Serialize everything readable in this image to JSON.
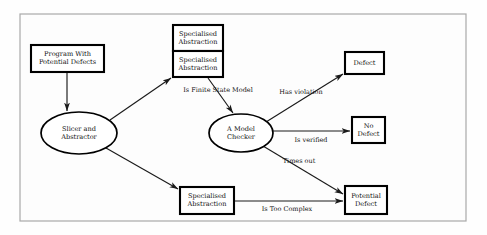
{
  "diagram": {
    "frame": {
      "x": 20,
      "y": 14,
      "width": 446,
      "height": 207
    },
    "colors": {
      "background": "#fefefe",
      "frame_stroke": "#a9a9a9",
      "node_stroke": "#000000",
      "node_fill": "#ffffff",
      "edge_stroke": "#1a1a1a",
      "text": "#111111"
    },
    "nodes": [
      {
        "id": "program",
        "shape": "rect",
        "lines": [
          "Program With",
          "Potential Defects"
        ],
        "x": 31,
        "y": 45,
        "width": 73,
        "height": 27
      },
      {
        "id": "spec-abstraction-top",
        "shape": "rect",
        "lines": [
          "Specialised",
          "Abstraction"
        ],
        "x": 173,
        "y": 25,
        "width": 50,
        "height": 26
      },
      {
        "id": "spec-abstraction-mid",
        "shape": "rect",
        "lines": [
          "Specialised",
          "Abstraction"
        ],
        "x": 173,
        "y": 51,
        "width": 50,
        "height": 26
      },
      {
        "id": "spec-abstraction-bottom",
        "shape": "rect",
        "lines": [
          "Specialised",
          "Abstraction"
        ],
        "x": 180,
        "y": 187,
        "width": 54,
        "height": 27
      },
      {
        "id": "defect",
        "shape": "rect",
        "lines": [
          "Defect"
        ],
        "x": 345,
        "y": 52,
        "width": 39,
        "height": 22
      },
      {
        "id": "no-defect",
        "shape": "rect",
        "lines": [
          "No",
          "Defect"
        ],
        "x": 352,
        "y": 117,
        "width": 33,
        "height": 26
      },
      {
        "id": "potential-defect",
        "shape": "rect",
        "lines": [
          "Potential",
          "Defect"
        ],
        "x": 345,
        "y": 186,
        "width": 42,
        "height": 28
      },
      {
        "id": "slicer",
        "shape": "ellipse",
        "lines": [
          "Slicer and",
          "Abstractor"
        ],
        "cx": 79,
        "cy": 133,
        "rx": 38,
        "ry": 21
      },
      {
        "id": "model-checker",
        "shape": "ellipse",
        "lines": [
          "A Model",
          "Checker"
        ],
        "cx": 241,
        "cy": 133,
        "rx": 32,
        "ry": 19
      }
    ],
    "edges": [
      {
        "id": "program-to-slicer",
        "from": "program",
        "to": "slicer",
        "x1": 67,
        "y1": 72,
        "x2": 67,
        "y2": 111,
        "label": ""
      },
      {
        "id": "slicer-to-spec-mid",
        "from": "slicer",
        "to": "spec-abstraction-mid",
        "x1": 110,
        "y1": 120,
        "x2": 171,
        "y2": 78,
        "label": ""
      },
      {
        "id": "spec-mid-to-model-checker",
        "from": "spec-abstraction-mid",
        "to": "model-checker",
        "x1": 208,
        "y1": 78,
        "x2": 233,
        "y2": 113,
        "label": "Is Finite State Model",
        "label_x": 218,
        "label_y": 90
      },
      {
        "id": "model-checker-to-defect",
        "from": "model-checker",
        "to": "defect",
        "x1": 266,
        "y1": 122,
        "x2": 343,
        "y2": 74,
        "label": "Has violation",
        "label_x": 301,
        "label_y": 92
      },
      {
        "id": "model-checker-to-no-defect",
        "from": "model-checker",
        "to": "no-defect",
        "x1": 273,
        "y1": 131,
        "x2": 350,
        "y2": 131,
        "label": "Is verified",
        "label_x": 311,
        "label_y": 140
      },
      {
        "id": "model-checker-to-potential-defect",
        "from": "model-checker",
        "to": "potential-defect",
        "x1": 263,
        "y1": 146,
        "x2": 343,
        "y2": 194,
        "label": "Times out",
        "label_x": 299,
        "label_y": 161
      },
      {
        "id": "slicer-to-spec-bottom",
        "from": "slicer",
        "to": "spec-abstraction-bottom",
        "x1": 106,
        "y1": 148,
        "x2": 178,
        "y2": 189,
        "label": ""
      },
      {
        "id": "spec-bottom-to-potential-defect",
        "from": "spec-abstraction-bottom",
        "to": "potential-defect",
        "x1": 234,
        "y1": 201,
        "x2": 343,
        "y2": 201,
        "label": "Is Too Complex",
        "label_x": 287,
        "label_y": 209
      }
    ]
  }
}
